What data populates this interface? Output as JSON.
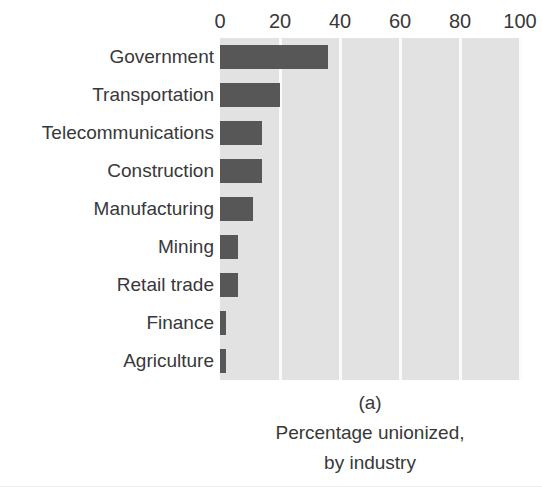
{
  "chart_data": {
    "type": "bar",
    "orientation": "horizontal",
    "title": "",
    "caption_label": "(a)",
    "caption_line1": "Percentage unionized,",
    "caption_line2": "by industry",
    "xlabel": "",
    "ylabel": "",
    "xlim": [
      0,
      100
    ],
    "ylim": null,
    "grid": true,
    "gridlines_at": [
      0,
      20,
      40,
      60,
      80,
      100
    ],
    "legend": null,
    "legend_position": "none",
    "xticks": [
      "0",
      "20",
      "40",
      "60",
      "80",
      "100"
    ],
    "xtick_values": [
      0,
      20,
      40,
      60,
      80,
      100
    ],
    "categories": [
      "Government",
      "Transportation",
      "Telecommunications",
      "Construction",
      "Manufacturing",
      "Mining",
      "Retail trade",
      "Finance",
      "Agriculture"
    ],
    "values": [
      36,
      20,
      14,
      14,
      11,
      6,
      6,
      2,
      2
    ],
    "colors": {
      "bar": "#575757",
      "plot_background": "#e2e2e2",
      "gridline": "#fbfbfb",
      "figure_background": "#ffffff",
      "text": "#38383a"
    }
  }
}
